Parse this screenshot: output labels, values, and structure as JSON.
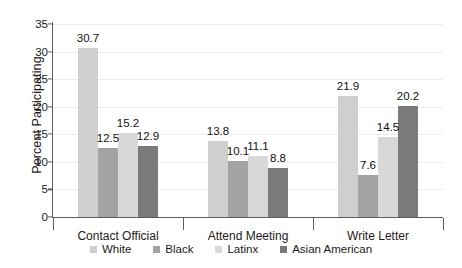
{
  "chart_data": {
    "type": "bar",
    "title": "",
    "xlabel": "",
    "ylabel": "Percent Participating",
    "ylim": [
      0,
      35
    ],
    "ytick_step": 5,
    "yticks": [
      0,
      5,
      10,
      15,
      20,
      25,
      30,
      35
    ],
    "grid": true,
    "legend_position": "bottom",
    "categories": [
      "Contact Official",
      "Attend Meeting",
      "Write Letter"
    ],
    "series": [
      {
        "name": "White",
        "color": "#cfcfcf",
        "values": [
          30.7,
          13.8,
          21.9
        ]
      },
      {
        "name": "Black",
        "color": "#a3a3a3",
        "values": [
          12.5,
          10.1,
          7.6
        ]
      },
      {
        "name": "Latinx",
        "color": "#d8d8d8",
        "values": [
          15.2,
          11.1,
          14.5
        ]
      },
      {
        "name": "Asian American",
        "color": "#7a7a7a",
        "values": [
          12.9,
          8.8,
          20.2
        ]
      }
    ],
    "value_labels": [
      [
        "30.7",
        "12.5",
        "15.2",
        "12.9"
      ],
      [
        "13.8",
        "10.1",
        "11.1",
        "8.8"
      ],
      [
        "21.9",
        "7.6",
        "14.5",
        "20.2"
      ]
    ]
  }
}
